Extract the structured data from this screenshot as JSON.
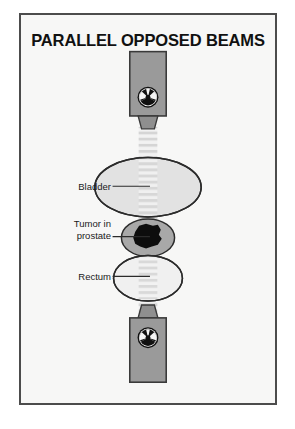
{
  "figure": {
    "title": "PARALLEL OPPOSED BEAMS",
    "background_color": "#f7f7f6",
    "border_color": "#4c4c4c"
  },
  "labels": {
    "bladder": "Bladder",
    "tumor_line1": "Tumor in",
    "tumor_line2": "prostate",
    "rectum": "Rectum"
  },
  "parts": {
    "top_source_name": "radiation-source-head-top",
    "bottom_source_name": "radiation-source-head-bottom",
    "top_collimator_name": "collimator-top",
    "bottom_collimator_name": "collimator-bottom",
    "beam_name": "radiation-beam",
    "bladder_name": "bladder-organ",
    "prostate_name": "prostate-organ",
    "tumor_name": "tumor-mass",
    "rectum_name": "rectum-organ"
  },
  "colors": {
    "machine_gray": "#9a9a9a",
    "machine_outline": "#3a3a3a",
    "collimator_gray": "#8f8f8f",
    "beam_stripe": "#d9d9d9",
    "bladder_fill": "#e2e2e2",
    "prostate_fill": "#a8a8a8",
    "rectum_fill": "#f0f0f0",
    "tumor_fill": "#0d0d0d",
    "organ_outline": "#2b2b2b",
    "leader_line": "#2b2b2b",
    "text": "#1a1a1a"
  },
  "radiation_symbol": {
    "name": "radiation-trefoil-icon",
    "ring_color": "#111111",
    "disc_color": "#f2f2f2",
    "blade_color": "#111111",
    "blade_count": 3
  }
}
